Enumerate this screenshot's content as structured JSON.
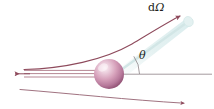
{
  "figure": {
    "background_color": "#ffffff",
    "width": 214,
    "height": 109
  },
  "labels": {
    "solid_angle_d": "d",
    "solid_angle_omega": "Ω",
    "scattering_angle": "θ"
  },
  "colors": {
    "trajectory": "#8e4a5c",
    "axis": "#9a8f93",
    "beam": "#a8707f",
    "cone_fill": "#e2efef",
    "cone_edge": "#cfe3e3",
    "sphere_light": "#f6e6ee",
    "sphere_mid": "#c78aa6",
    "sphere_dark": "#8e4a70",
    "text": "#231f20"
  },
  "geometry": {
    "sphere_center_x": 109,
    "sphere_center_y": 74,
    "sphere_radius": 15,
    "axis_y": 74,
    "axis_x_start": 109,
    "axis_x_end": 212,
    "arc_radius": 30,
    "scattering_angle_degrees": 34
  },
  "elements": {
    "incident_beam_name": "incident particle beam",
    "scattered_trajectory_name": "scattered trajectory",
    "target_name": "target nucleus",
    "detector_cone_name": "solid angle cone",
    "axis_name": "beam axis",
    "lower_trajectory_name": "lower deflected trajectory"
  }
}
